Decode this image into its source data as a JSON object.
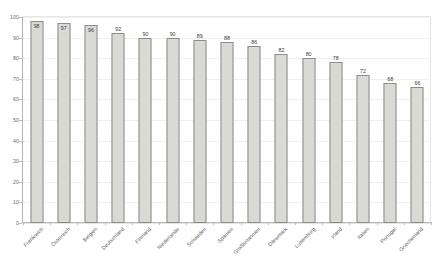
{
  "chart_data": {
    "type": "bar",
    "title": "",
    "subtitle": "",
    "xlabel": "",
    "ylabel": "",
    "ylim": [
      0,
      100
    ],
    "grid": true,
    "legend": "none",
    "categories": [
      "Frankreich",
      "Österreich",
      "Belgien",
      "Deutschland",
      "Finnland",
      "Niederlande",
      "Schweden",
      "Spanien",
      "Großbritannien",
      "Dänemark",
      "Luxemburg",
      "Irland",
      "Italien",
      "Portugal",
      "Griechenland"
    ],
    "values": [
      98,
      97,
      96,
      92,
      90,
      90,
      89,
      88,
      86,
      82,
      80,
      78,
      72,
      68,
      66
    ],
    "data_labels": [
      "98",
      "97",
      "96",
      "92",
      "90",
      "90",
      "89",
      "88",
      "86",
      "82",
      "80",
      "78",
      "72",
      "68",
      "66"
    ],
    "yticks": [
      0,
      10,
      20,
      30,
      40,
      50,
      60,
      70,
      80,
      90,
      100
    ],
    "ytick_labels": [
      "0",
      "10",
      "20",
      "30",
      "40",
      "50",
      "60",
      "70",
      "80",
      "90",
      "100"
    ],
    "colors": {
      "bar_fill": "#d9d9d6",
      "bar_border": "#8c8c8c",
      "gridline": "#f0f0f0",
      "axis": "#b5b5b5",
      "tick_text": "#6b6b6b",
      "label_text": "#5a5a5a",
      "value_text": "#3a3a3a",
      "background": "#ffffff"
    }
  }
}
